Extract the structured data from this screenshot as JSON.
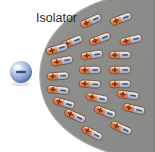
{
  "figure": {
    "title": "Isolator",
    "type": "physics-diagram"
  },
  "labels": {
    "isolator": "Isolator",
    "isolator_x": 36,
    "isolator_y": 22
  },
  "charge": {
    "name": "negative-point-charge",
    "symbol": "–",
    "cx": 21,
    "cy": 72,
    "r": 11,
    "color_light": "#eef2fa",
    "color_mid": "#9db3dc",
    "color_dark": "#5a74ac",
    "sign_color": "#3b4f7d"
  },
  "dielectric": {
    "name": "isolator-body",
    "fill": "#8f9090",
    "stroke": "#6f7070",
    "edge_highlight": "#c9cac8",
    "outline_width": 1.0
  },
  "dipole_style": {
    "plus_fill": "#e08a5a",
    "plus_fill_light": "#f4c2a1",
    "minus_fill": "#b9c3d2",
    "minus_fill_light": "#e2e8f0",
    "body_stroke": "#7a5540",
    "plus_sign": "+",
    "minus_sign": "–",
    "sign_color_plus": "#7a2f12",
    "sign_color_minus": "#41506b",
    "length": 22,
    "thickness": 7.5
  },
  "chart_data": {
    "type": "scatter",
    "title": "Isolator",
    "xlabel": "",
    "ylabel": "",
    "xlim": [
      0,
      155
    ],
    "ylim": [
      0,
      152
    ],
    "grid": false,
    "legend": null,
    "annotations": [
      {
        "text": "Isolator",
        "x": 36,
        "y": 22
      }
    ],
    "series": [
      {
        "name": "negative-charge",
        "marker": "sphere",
        "points": [
          {
            "x": 21,
            "y": 72,
            "charge": "-"
          }
        ]
      },
      {
        "name": "dipoles",
        "marker": "capsule",
        "points": [
          {
            "x": 91,
            "y": 21,
            "angle": -24
          },
          {
            "x": 121,
            "y": 19,
            "angle": -20
          },
          {
            "x": 72,
            "y": 42,
            "angle": -22
          },
          {
            "x": 100,
            "y": 39,
            "angle": -20
          },
          {
            "x": 131,
            "y": 40,
            "angle": -13
          },
          {
            "x": 57,
            "y": 49,
            "angle": -16
          },
          {
            "x": 62,
            "y": 61,
            "angle": -10
          },
          {
            "x": 92,
            "y": 55,
            "angle": -8
          },
          {
            "x": 120,
            "y": 55,
            "angle": 0
          },
          {
            "x": 58,
            "y": 76,
            "angle": -3
          },
          {
            "x": 90,
            "y": 70,
            "angle": 0
          },
          {
            "x": 120,
            "y": 70,
            "angle": 0
          },
          {
            "x": 58,
            "y": 90,
            "angle": 6
          },
          {
            "x": 90,
            "y": 84,
            "angle": 3
          },
          {
            "x": 120,
            "y": 84,
            "angle": 0
          },
          {
            "x": 64,
            "y": 103,
            "angle": 16
          },
          {
            "x": 97,
            "y": 98,
            "angle": 12
          },
          {
            "x": 128,
            "y": 95,
            "angle": 8
          },
          {
            "x": 75,
            "y": 116,
            "angle": 24
          },
          {
            "x": 105,
            "y": 112,
            "angle": 20
          },
          {
            "x": 134,
            "y": 109,
            "angle": 14
          },
          {
            "x": 92,
            "y": 133,
            "angle": 28
          },
          {
            "x": 121,
            "y": 128,
            "angle": 24
          }
        ]
      }
    ]
  }
}
